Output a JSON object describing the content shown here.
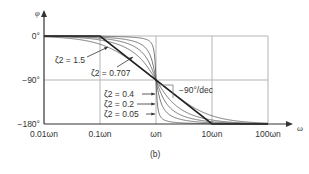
{
  "chart_data": {
    "type": "line",
    "title": "",
    "caption": "(b)",
    "ylabel": "φ",
    "xlabel": "ω",
    "xscale": "log",
    "xlim_decades_rel_wn": [
      -2,
      2
    ],
    "ylim": [
      -180,
      0
    ],
    "grid": true,
    "x_ticks": [
      {
        "value": 0.01,
        "label": "0.01ωn"
      },
      {
        "value": 0.1,
        "label": "0.1ωn"
      },
      {
        "value": 1,
        "label": "ωn"
      },
      {
        "value": 10,
        "label": "10ωn"
      },
      {
        "value": 100,
        "label": "100ωn"
      }
    ],
    "y_ticks": [
      {
        "value": 0,
        "label": "0°"
      },
      {
        "value": -90,
        "label": "−90°"
      },
      {
        "value": -180,
        "label": "−180°"
      }
    ],
    "series": [
      {
        "name": "ζ2 = 1.5",
        "zeta": 1.5
      },
      {
        "name": "ζ2 = 0.707",
        "zeta": 0.707
      },
      {
        "name": "ζ2 = 0.4",
        "zeta": 0.4
      },
      {
        "name": "ζ2 = 0.2",
        "zeta": 0.2
      },
      {
        "name": "ζ2 = 0.05",
        "zeta": 0.05
      }
    ],
    "asymptote": {
      "label": "−90°/dec",
      "points": [
        [
          0.1,
          0
        ],
        [
          10,
          -180
        ]
      ],
      "slope_deg_per_decade": -90
    },
    "annotations": {
      "z15": "ζ2 = 1.5",
      "z0707": "ζ2 = 0.707",
      "z04": "ζ2 = 0.4",
      "z02": "ζ2 = 0.2",
      "z005": "ζ2 = 0.05",
      "slope": "−90°/dec"
    }
  }
}
